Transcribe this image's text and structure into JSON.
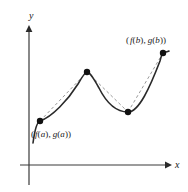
{
  "figure": {
    "width": 188,
    "height": 192,
    "background_color": "#ffffff"
  },
  "axes": {
    "x_axis": {
      "label": "x",
      "color": "#3a3a3a",
      "line": {
        "x1": 20,
        "y1": 165,
        "x2": 168,
        "y2": 165
      },
      "arrow_tip": {
        "x": 172,
        "y": 165
      },
      "label_position": {
        "x": 175,
        "y": 160
      }
    },
    "y_axis": {
      "label": "y",
      "color": "#3a3a3a",
      "line": {
        "x1": 29,
        "y1": 29,
        "x2": 29,
        "y2": 185
      },
      "arrow_tip": {
        "x": 29,
        "y": 25
      },
      "label_position": {
        "x": 29,
        "y": 11
      }
    }
  },
  "chart_data": {
    "type": "line",
    "title": "",
    "xlabel": "x",
    "ylabel": "y",
    "grid": false,
    "legend": null,
    "origin_px": {
      "x": 29,
      "y": 165
    },
    "points_px": [
      {
        "name": "point-a",
        "x": 40,
        "y": 121
      },
      {
        "name": "point-peak",
        "x": 87,
        "y": 72
      },
      {
        "name": "point-valley",
        "x": 128,
        "y": 112
      },
      {
        "name": "point-b",
        "x": 163,
        "y": 53
      }
    ],
    "curve_color": "#2a2a2a",
    "curve_width": 1.6,
    "curve_path": "M 33,143 C 35,128 37,122 40,121 C 52,117 68,100 78,84 C 82,77 85,72 87,72 C 90,72 94,79 99,88 C 107,104 116,112 128,112 C 139,112 150,87 160,61 C 161,57 162,54 163,53 C 165,52 167,52 169,51",
    "chords": [
      {
        "name": "chord-a-peak",
        "from": [
          40,
          121
        ],
        "to": [
          87,
          72
        ]
      },
      {
        "name": "chord-peak-valley",
        "from": [
          87,
          72
        ],
        "to": [
          128,
          112
        ]
      },
      {
        "name": "chord-valley-b",
        "from": [
          128,
          112
        ],
        "to": [
          163,
          53
        ]
      }
    ],
    "chord_color": "#9a9a9a",
    "chord_width": 1.0,
    "chord_dash": "3,2.5",
    "dot_color": "#111111",
    "dot_radius": 3.2
  },
  "annotations": {
    "point_a_label": {
      "full_text": "( f(a), g(a))",
      "segments": [
        "(",
        "f",
        "(",
        "a",
        "), ",
        "g",
        "(",
        "a",
        "))"
      ],
      "target_point": "point-a",
      "position": {
        "x": 31,
        "y": 130
      }
    },
    "point_b_label": {
      "full_text": "( f(b), g(b))",
      "segments": [
        "(",
        "f",
        "(",
        "b",
        "), ",
        "g",
        "(",
        "b",
        "))"
      ],
      "target_point": "point-b",
      "position": {
        "x": 126,
        "y": 36
      }
    }
  }
}
